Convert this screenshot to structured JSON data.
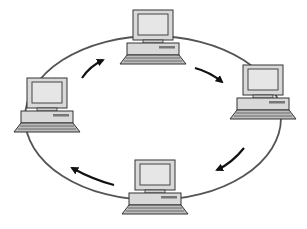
{
  "diagram": {
    "title": "",
    "type": "ring-network-topology",
    "nodes": [
      {
        "id": "top",
        "kind": "computer-icon"
      },
      {
        "id": "right",
        "kind": "computer-icon"
      },
      {
        "id": "bottom",
        "kind": "computer-icon"
      },
      {
        "id": "left",
        "kind": "computer-icon"
      }
    ],
    "edges": [
      {
        "from": "left",
        "to": "top",
        "direction": "clockwise"
      },
      {
        "from": "top",
        "to": "right",
        "direction": "clockwise"
      },
      {
        "from": "right",
        "to": "bottom",
        "direction": "clockwise"
      },
      {
        "from": "bottom",
        "to": "left",
        "direction": "clockwise"
      }
    ],
    "colors": {
      "ring": "#555555",
      "arrow": "#111111",
      "computer_fill": "#d9d9d9",
      "screen_fill": "#e6e6e6",
      "outline": "#333333"
    }
  }
}
